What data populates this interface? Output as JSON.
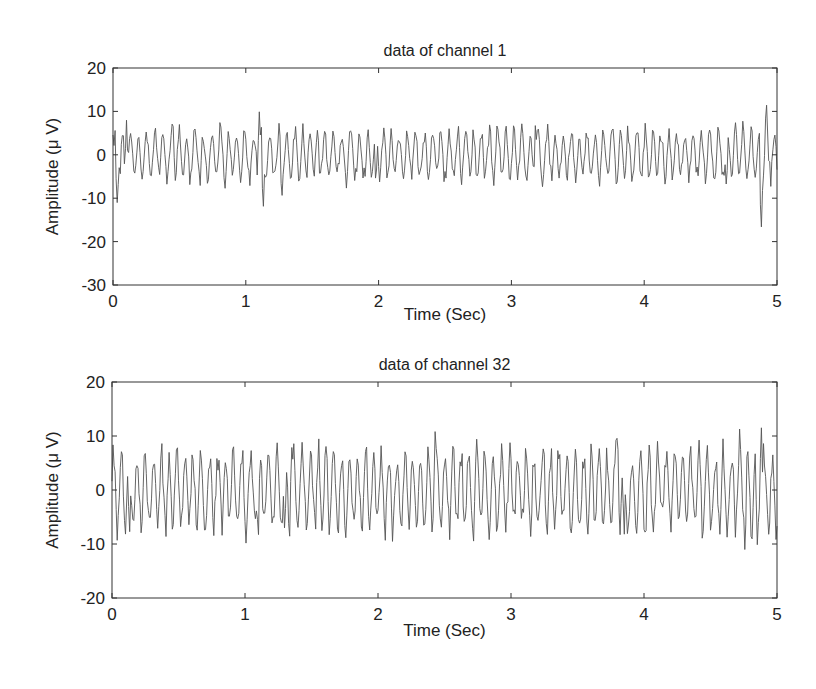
{
  "chart_data": [
    {
      "type": "line",
      "title": "data of channel 1",
      "xlabel": "Time (Sec)",
      "ylabel": "Amplitude (μ V)",
      "xlim": [
        0,
        5
      ],
      "ylim": [
        -30,
        20
      ],
      "xticks": [
        "0",
        "1",
        "2",
        "3",
        "4",
        "5"
      ],
      "yticks": [
        "20",
        "10",
        "0",
        "-10",
        "-20",
        "-30"
      ],
      "grid": false,
      "series": [
        {
          "name": "channel 1",
          "color": "#555555",
          "peaks": [
            {
              "x": 0.03,
              "y": -12
            },
            {
              "x": 0.1,
              "y": 10
            },
            {
              "x": 0.45,
              "y": 8
            },
            {
              "x": 1.1,
              "y": 12
            },
            {
              "x": 1.13,
              "y": -16
            },
            {
              "x": 1.27,
              "y": -11
            },
            {
              "x": 1.98,
              "y": -9
            },
            {
              "x": 3.18,
              "y": 7
            },
            {
              "x": 4.62,
              "y": -10
            },
            {
              "x": 4.88,
              "y": -21
            },
            {
              "x": 4.92,
              "y": 13
            }
          ],
          "range_typical": [
            -6,
            7
          ]
        }
      ]
    },
    {
      "type": "line",
      "title": "data of channel 32",
      "xlabel": "Time (Sec)",
      "ylabel": "Amplitude (μ V)",
      "xlim": [
        0,
        5
      ],
      "ylim": [
        -20,
        20
      ],
      "xticks": [
        "0",
        "1",
        "2",
        "3",
        "4",
        "5"
      ],
      "yticks": [
        "20",
        "10",
        "0",
        "-10",
        "-20"
      ],
      "grid": false,
      "series": [
        {
          "name": "channel 32",
          "color": "#555555",
          "peaks": [
            {
              "x": 0.13,
              "y": -11
            },
            {
              "x": 1.1,
              "y": -10
            },
            {
              "x": 1.3,
              "y": -11
            },
            {
              "x": 1.35,
              "y": 9
            },
            {
              "x": 2.43,
              "y": 11
            },
            {
              "x": 3.8,
              "y": 12
            },
            {
              "x": 3.85,
              "y": -10
            },
            {
              "x": 4.72,
              "y": 12
            },
            {
              "x": 4.76,
              "y": -12
            },
            {
              "x": 4.88,
              "y": 16
            },
            {
              "x": 4.85,
              "y": -12
            }
          ],
          "range_typical": [
            -8,
            9
          ]
        }
      ]
    }
  ]
}
